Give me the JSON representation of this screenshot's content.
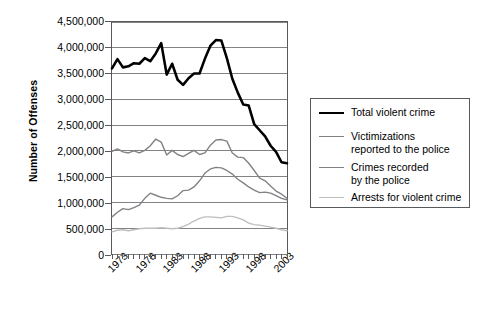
{
  "chart_data": {
    "type": "line",
    "title": "",
    "xlabel": "",
    "ylabel": "Number of Offenses",
    "grid": true,
    "legend_position": "right",
    "xlim": [
      1973,
      2005
    ],
    "ylim": [
      0,
      4500000
    ],
    "ytick_labels": [
      "4,500,000",
      "4,000,000",
      "3,500,000",
      "3,000,000",
      "2,500,000",
      "2,000,000",
      "1,500,000",
      "1,000,000",
      "500,000",
      "0"
    ],
    "ytick_values": [
      4500000,
      4000000,
      3500000,
      3000000,
      2500000,
      2000000,
      1500000,
      1000000,
      500000,
      0
    ],
    "xtick_labels": [
      "1973",
      "1978",
      "1983",
      "1988",
      "1993",
      "1998",
      "2003"
    ],
    "xtick_values": [
      1973,
      1978,
      1983,
      1988,
      1993,
      1998,
      2003
    ],
    "x": [
      1973,
      1974,
      1975,
      1976,
      1977,
      1978,
      1979,
      1980,
      1981,
      1982,
      1983,
      1984,
      1985,
      1986,
      1987,
      1988,
      1989,
      1990,
      1991,
      1992,
      1993,
      1994,
      1995,
      1996,
      1997,
      1998,
      1999,
      2000,
      2001,
      2002,
      2003,
      2004,
      2005
    ],
    "series": [
      {
        "name": "Total violent crime",
        "color": "#000000",
        "width": 2.6,
        "values": [
          3600000,
          3780000,
          3620000,
          3640000,
          3700000,
          3690000,
          3800000,
          3740000,
          3890000,
          4090000,
          3480000,
          3690000,
          3380000,
          3280000,
          3410000,
          3500000,
          3500000,
          3790000,
          4040000,
          4150000,
          4140000,
          3800000,
          3400000,
          3130000,
          2900000,
          2880000,
          2520000,
          2400000,
          2280000,
          2100000,
          1980000,
          1780000,
          1760000
        ]
      },
      {
        "name": "Victimizations\nreported to the police",
        "color": "#808285",
        "width": 1.4,
        "values": [
          1990000,
          2040000,
          1980000,
          1960000,
          2000000,
          1960000,
          2010000,
          2100000,
          2230000,
          2170000,
          1920000,
          2010000,
          1930000,
          1890000,
          1950000,
          2010000,
          1930000,
          1960000,
          2110000,
          2210000,
          2220000,
          2190000,
          1960000,
          1880000,
          1870000,
          1760000,
          1620000,
          1470000,
          1420000,
          1320000,
          1220000,
          1160000,
          1080000
        ]
      },
      {
        "name": "Crimes recorded\nby the police",
        "color": "#808285",
        "width": 1.4,
        "values": [
          720000,
          810000,
          880000,
          860000,
          900000,
          950000,
          1080000,
          1180000,
          1140000,
          1100000,
          1080000,
          1070000,
          1130000,
          1230000,
          1240000,
          1300000,
          1420000,
          1570000,
          1650000,
          1680000,
          1670000,
          1620000,
          1550000,
          1450000,
          1380000,
          1300000,
          1240000,
          1190000,
          1200000,
          1180000,
          1130000,
          1080000,
          1050000
        ]
      },
      {
        "name": "Arrests for violent crime",
        "color": "#bcbec0",
        "width": 1.4,
        "values": [
          430000,
          460000,
          470000,
          450000,
          470000,
          490000,
          500000,
          500000,
          500000,
          510000,
          500000,
          490000,
          500000,
          530000,
          580000,
          640000,
          690000,
          720000,
          720000,
          710000,
          700000,
          730000,
          730000,
          700000,
          660000,
          600000,
          570000,
          560000,
          540000,
          520000,
          500000,
          470000,
          450000
        ]
      }
    ]
  },
  "legend": {
    "items": [
      {
        "label": "Total violent crime",
        "color": "#000000"
      },
      {
        "label": "Victimizations\nreported to the police",
        "color": "#808285"
      },
      {
        "label": "Crimes recorded\nby the police",
        "color": "#808285"
      },
      {
        "label": "Arrests for violent crime",
        "color": "#bcbec0"
      }
    ]
  },
  "axis": {
    "y_title": "Number of Offenses"
  }
}
